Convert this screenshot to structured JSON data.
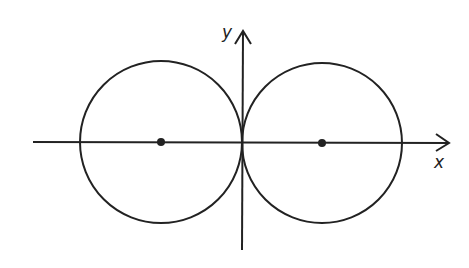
{
  "diagram": {
    "stroke_color": "#222222",
    "background": "#ffffff",
    "axes": {
      "x_label": "x",
      "y_label": "y",
      "origin_px": [
        242,
        142
      ],
      "x_axis_px": {
        "from": 33,
        "to": 450
      },
      "y_axis_px": {
        "from": 250,
        "to": 30
      }
    },
    "circles": [
      {
        "name": "left-circle",
        "center_px": [
          161,
          142
        ],
        "radius_px": 81,
        "center_marked": true
      },
      {
        "name": "right-circle",
        "center_px": [
          322,
          143
        ],
        "radius_px": 80,
        "center_marked": true
      }
    ],
    "tangent_point": "origin"
  }
}
